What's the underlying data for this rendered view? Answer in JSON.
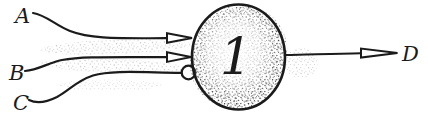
{
  "diagram": {
    "kind": "neuron-logic-unit",
    "background_color": "#ffffff",
    "ink_color": "#1b1b1b",
    "inputs": [
      {
        "label": "A",
        "synapse_icon": "excitatory-arrowhead"
      },
      {
        "label": "B",
        "synapse_icon": "excitatory-arrowhead"
      },
      {
        "label": "C",
        "synapse_icon": "inhibitory-circle"
      }
    ],
    "neuron": {
      "threshold_label": "1"
    },
    "output": {
      "label": "D",
      "arrow_icon": "open-arrowhead"
    }
  }
}
